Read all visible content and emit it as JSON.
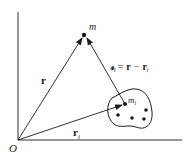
{
  "diagram": {
    "origin_label": "O",
    "point_m_label": "m",
    "point_mi_label": "m",
    "point_mi_sub": "i",
    "vector_r_label": "r",
    "vector_ri_label": "r",
    "vector_ri_sub": "i",
    "relation": {
      "lhs": "𝓇",
      "lhs_sub": "i",
      "equals": "=",
      "term1": "r",
      "minus": "−",
      "term2": "r",
      "term2_sub": "i"
    },
    "colors": {
      "ink": "#1a1a1a",
      "background": "#ffffff"
    }
  }
}
